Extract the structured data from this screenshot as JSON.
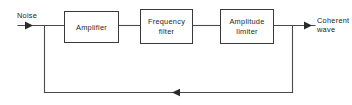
{
  "diagram": {
    "background_color": "#ffffff",
    "line_color": "#4a4a4a",
    "box_stroke_color": "#3a3a3a",
    "text_color": "#1d1d1d",
    "blocks": [
      {
        "id": "amplifier",
        "label_line1": "Amplifier",
        "label_line2": "",
        "x": 64,
        "y": 11,
        "w": 54,
        "h": 31
      },
      {
        "id": "frequency-filter",
        "label_line1": "Frequency",
        "label_line2": "filter",
        "x": 140,
        "y": 9,
        "w": 52,
        "h": 34
      },
      {
        "id": "amplitude-limiter",
        "label_line1": "Amplitude",
        "label_line2": "limiter",
        "x": 220,
        "y": 9,
        "w": 53,
        "h": 34
      }
    ],
    "io": {
      "input_label": "Noise",
      "output_label_line1": "Coherent",
      "output_label_line2": "wave"
    },
    "feedback": {
      "direction": "right-to-left",
      "arrow_x": 175,
      "line_y": 92
    }
  }
}
